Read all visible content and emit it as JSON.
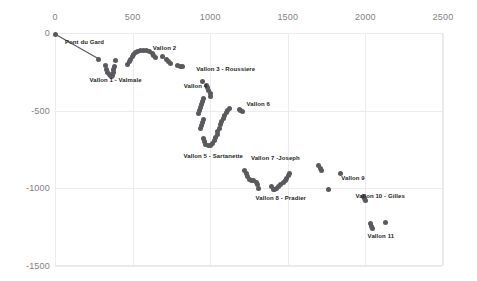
{
  "chart_data": {
    "type": "scatter",
    "title": "",
    "xlabel": "",
    "ylabel": "",
    "xlim": [
      0,
      2500
    ],
    "ylim": [
      -1500,
      0
    ],
    "xticks": [
      "0",
      "500",
      "1000",
      "1500",
      "2000",
      "2500"
    ],
    "yticks": [
      "0",
      "-500",
      "-1000",
      "-1500"
    ],
    "xtick_values": [
      0,
      500,
      1000,
      1500,
      2000,
      2500
    ],
    "ytick_values": [
      0,
      -500,
      -1000,
      -1500
    ],
    "grid": true,
    "legend": "none",
    "xaxis_position": "top",
    "marker_color": "#5a5a5e",
    "line_color": "#5a5a5e",
    "annotations": [
      {
        "text": "Pont du Gard",
        "x": 190,
        "y": -60
      },
      {
        "text": "Vallon 1 - Valmale",
        "x": 390,
        "y": -300
      },
      {
        "text": "Vallon 2",
        "x": 705,
        "y": -95
      },
      {
        "text": "Vallon 3 - Roussiere",
        "x": 1100,
        "y": -230
      },
      {
        "text": "Vallon 4",
        "x": 905,
        "y": -340
      },
      {
        "text": "Vallon 6",
        "x": 1310,
        "y": -455
      },
      {
        "text": "Vallon 5 - Sartanette",
        "x": 1020,
        "y": -790
      },
      {
        "text": "Vallon 7 -Joseph",
        "x": 1420,
        "y": -805
      },
      {
        "text": "Vallon 8 - Pradier",
        "x": 1455,
        "y": -1065
      },
      {
        "text": "Vallon 9",
        "x": 1920,
        "y": -935
      },
      {
        "text": "Vallon 10 - Gilles",
        "x": 2095,
        "y": -1050
      },
      {
        "text": "Vallon 11",
        "x": 2100,
        "y": -1310
      }
    ],
    "series": [
      {
        "name": "aqueduct-profile",
        "style": "line+markers",
        "points": [
          {
            "x": 5,
            "y": -10
          },
          {
            "x": 283,
            "y": -168
          }
        ]
      },
      {
        "name": "scatter-points",
        "style": "markers",
        "points": [
          {
            "x": 327,
            "y": -212
          },
          {
            "x": 335,
            "y": -232
          },
          {
            "x": 340,
            "y": -252
          },
          {
            "x": 348,
            "y": -268
          },
          {
            "x": 355,
            "y": -275
          },
          {
            "x": 362,
            "y": -280
          },
          {
            "x": 370,
            "y": -272
          },
          {
            "x": 376,
            "y": -255
          },
          {
            "x": 380,
            "y": -236
          },
          {
            "x": 385,
            "y": -216
          },
          {
            "x": 392,
            "y": -180
          },
          {
            "x": 470,
            "y": -200
          },
          {
            "x": 478,
            "y": -183
          },
          {
            "x": 487,
            "y": -168
          },
          {
            "x": 497,
            "y": -152
          },
          {
            "x": 508,
            "y": -136
          },
          {
            "x": 520,
            "y": -124
          },
          {
            "x": 534,
            "y": -118
          },
          {
            "x": 552,
            "y": -114
          },
          {
            "x": 570,
            "y": -110
          },
          {
            "x": 592,
            "y": -112
          },
          {
            "x": 612,
            "y": -122
          },
          {
            "x": 626,
            "y": -134
          },
          {
            "x": 636,
            "y": -146
          },
          {
            "x": 645,
            "y": -158
          },
          {
            "x": 690,
            "y": -152
          },
          {
            "x": 718,
            "y": -170
          },
          {
            "x": 730,
            "y": -184
          },
          {
            "x": 742,
            "y": -196
          },
          {
            "x": 792,
            "y": -212
          },
          {
            "x": 806,
            "y": -216
          },
          {
            "x": 820,
            "y": -214
          },
          {
            "x": 952,
            "y": -312
          },
          {
            "x": 975,
            "y": -336
          },
          {
            "x": 985,
            "y": -352
          },
          {
            "x": 992,
            "y": -370
          },
          {
            "x": 1000,
            "y": -388
          },
          {
            "x": 1005,
            "y": -406
          },
          {
            "x": 960,
            "y": -420
          },
          {
            "x": 952,
            "y": -440
          },
          {
            "x": 945,
            "y": -462
          },
          {
            "x": 938,
            "y": -482
          },
          {
            "x": 932,
            "y": -500
          },
          {
            "x": 925,
            "y": -520
          },
          {
            "x": 955,
            "y": -556
          },
          {
            "x": 948,
            "y": -576
          },
          {
            "x": 942,
            "y": -598
          },
          {
            "x": 936,
            "y": -618
          },
          {
            "x": 958,
            "y": -680
          },
          {
            "x": 962,
            "y": -700
          },
          {
            "x": 972,
            "y": -716
          },
          {
            "x": 986,
            "y": -726
          },
          {
            "x": 1002,
            "y": -722
          },
          {
            "x": 1016,
            "y": -710
          },
          {
            "x": 1028,
            "y": -692
          },
          {
            "x": 1036,
            "y": -672
          },
          {
            "x": 1044,
            "y": -652
          },
          {
            "x": 1050,
            "y": -632
          },
          {
            "x": 1058,
            "y": -612
          },
          {
            "x": 1066,
            "y": -592
          },
          {
            "x": 1074,
            "y": -572
          },
          {
            "x": 1084,
            "y": -552
          },
          {
            "x": 1094,
            "y": -534
          },
          {
            "x": 1102,
            "y": -514
          },
          {
            "x": 1112,
            "y": -498
          },
          {
            "x": 1126,
            "y": -484
          },
          {
            "x": 1186,
            "y": -492
          },
          {
            "x": 1196,
            "y": -500
          },
          {
            "x": 1206,
            "y": -508
          },
          {
            "x": 1224,
            "y": -886
          },
          {
            "x": 1232,
            "y": -906
          },
          {
            "x": 1240,
            "y": -926
          },
          {
            "x": 1250,
            "y": -944
          },
          {
            "x": 1266,
            "y": -952
          },
          {
            "x": 1282,
            "y": -950
          },
          {
            "x": 1298,
            "y": -960
          },
          {
            "x": 1306,
            "y": -978
          },
          {
            "x": 1312,
            "y": -998
          },
          {
            "x": 1398,
            "y": -988
          },
          {
            "x": 1406,
            "y": -1008
          },
          {
            "x": 1416,
            "y": -1006
          },
          {
            "x": 1430,
            "y": -998
          },
          {
            "x": 1442,
            "y": -986
          },
          {
            "x": 1456,
            "y": -976
          },
          {
            "x": 1470,
            "y": -962
          },
          {
            "x": 1482,
            "y": -948
          },
          {
            "x": 1494,
            "y": -934
          },
          {
            "x": 1504,
            "y": -920
          },
          {
            "x": 1512,
            "y": -906
          },
          {
            "x": 1700,
            "y": -856
          },
          {
            "x": 1710,
            "y": -872
          },
          {
            "x": 1718,
            "y": -886
          },
          {
            "x": 1838,
            "y": -906
          },
          {
            "x": 1760,
            "y": -1010
          },
          {
            "x": 1986,
            "y": -1052
          },
          {
            "x": 1994,
            "y": -1064
          },
          {
            "x": 1998,
            "y": -1076
          },
          {
            "x": 2036,
            "y": -1228
          },
          {
            "x": 2042,
            "y": -1246
          },
          {
            "x": 2046,
            "y": -1260
          },
          {
            "x": 2130,
            "y": -1222
          }
        ]
      }
    ]
  }
}
